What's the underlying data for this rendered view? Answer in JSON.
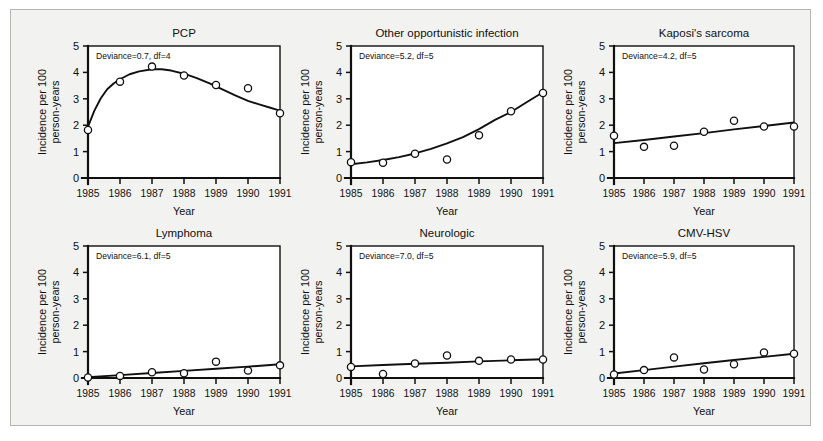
{
  "figure": {
    "background_color": "#f2f2f0",
    "border_color": "#b4b4b2",
    "plot_background": "#ffffff",
    "ink_color": "#101010"
  },
  "axes": {
    "xlabel": "Year",
    "ylabel_line1": "Incidence per 100",
    "ylabel_line2": "person-years",
    "x_tick_labels": [
      "1985",
      "1986",
      "1987",
      "1988",
      "1989",
      "1990",
      "1991"
    ],
    "y_tick_labels": [
      "0",
      "1",
      "2",
      "3",
      "4",
      "5"
    ],
    "xlim": [
      1985,
      1991
    ],
    "ylim": [
      0,
      5
    ]
  },
  "chart_data": [
    {
      "type": "scatter",
      "title": "PCP",
      "annotation": "Deviance=0.7, df=4",
      "deviance": 0.7,
      "df": 4,
      "xlabel": "Year",
      "ylabel": "Incidence per 100 person-years",
      "xlim": [
        1985,
        1991
      ],
      "ylim": [
        0,
        5
      ],
      "grid": false,
      "x": [
        1985,
        1986,
        1987,
        1988,
        1989,
        1990,
        1991
      ],
      "values": [
        1.82,
        3.65,
        4.22,
        3.88,
        3.52,
        3.4,
        2.45
      ],
      "fit_curve": [
        [
          1985.0,
          1.95
        ],
        [
          1985.2,
          2.55
        ],
        [
          1985.4,
          3.02
        ],
        [
          1985.6,
          3.36
        ],
        [
          1985.8,
          3.58
        ],
        [
          1986.0,
          3.74
        ],
        [
          1986.3,
          3.93
        ],
        [
          1986.6,
          4.04
        ],
        [
          1987.0,
          4.12
        ],
        [
          1987.3,
          4.12
        ],
        [
          1987.6,
          4.07
        ],
        [
          1988.0,
          3.95
        ],
        [
          1988.4,
          3.78
        ],
        [
          1988.8,
          3.58
        ],
        [
          1989.2,
          3.36
        ],
        [
          1989.6,
          3.13
        ],
        [
          1990.0,
          2.92
        ],
        [
          1990.4,
          2.77
        ],
        [
          1990.7,
          2.66
        ],
        [
          1991.0,
          2.55
        ]
      ]
    },
    {
      "type": "scatter",
      "title": "Other opportunistic infection",
      "annotation": "Deviance=5.2, df=5",
      "deviance": 5.2,
      "df": 5,
      "xlabel": "Year",
      "ylabel": "Incidence per 100 person-years",
      "xlim": [
        1985,
        1991
      ],
      "ylim": [
        0,
        5
      ],
      "grid": false,
      "x": [
        1985,
        1986,
        1987,
        1988,
        1989,
        1990,
        1991
      ],
      "values": [
        0.6,
        0.58,
        0.92,
        0.7,
        1.62,
        2.53,
        3.22
      ],
      "fit_curve": [
        [
          1985.0,
          0.52
        ],
        [
          1985.5,
          0.59
        ],
        [
          1986.0,
          0.68
        ],
        [
          1986.5,
          0.79
        ],
        [
          1987.0,
          0.93
        ],
        [
          1987.5,
          1.1
        ],
        [
          1988.0,
          1.31
        ],
        [
          1988.5,
          1.55
        ],
        [
          1989.0,
          1.85
        ],
        [
          1989.5,
          2.2
        ],
        [
          1990.0,
          2.5
        ],
        [
          1990.5,
          2.88
        ],
        [
          1991.0,
          3.25
        ]
      ]
    },
    {
      "type": "scatter",
      "title": "Kaposi's sarcoma",
      "annotation": "Deviance=4.2, df=5",
      "deviance": 4.2,
      "df": 5,
      "xlabel": "Year",
      "ylabel": "Incidence per 100 person-years",
      "xlim": [
        1985,
        1991
      ],
      "ylim": [
        0,
        5
      ],
      "grid": false,
      "x": [
        1985,
        1986,
        1987,
        1988,
        1989,
        1990,
        1991
      ],
      "values": [
        1.6,
        1.18,
        1.22,
        1.75,
        2.17,
        1.95,
        1.95
      ],
      "fit_curve": [
        [
          1985.0,
          1.32
        ],
        [
          1986.0,
          1.44
        ],
        [
          1987.0,
          1.57
        ],
        [
          1988.0,
          1.7
        ],
        [
          1989.0,
          1.84
        ],
        [
          1990.0,
          1.97
        ],
        [
          1991.0,
          2.1
        ]
      ]
    },
    {
      "type": "scatter",
      "title": "Lymphoma",
      "annotation": "Deviance=6.1, df=5",
      "deviance": 6.1,
      "df": 5,
      "xlabel": "Year",
      "ylabel": "Incidence per 100 person-years",
      "xlim": [
        1985,
        1991
      ],
      "ylim": [
        0,
        5
      ],
      "grid": false,
      "x": [
        1985,
        1986,
        1987,
        1988,
        1989,
        1990,
        1991
      ],
      "values": [
        0.02,
        0.08,
        0.22,
        0.18,
        0.62,
        0.28,
        0.48
      ],
      "fit_curve": [
        [
          1985.0,
          0.03
        ],
        [
          1986.0,
          0.11
        ],
        [
          1987.0,
          0.19
        ],
        [
          1988.0,
          0.27
        ],
        [
          1989.0,
          0.35
        ],
        [
          1990.0,
          0.43
        ],
        [
          1991.0,
          0.52
        ]
      ]
    },
    {
      "type": "scatter",
      "title": "Neurologic",
      "annotation": "Deviance=7.0, df=5",
      "deviance": 7.0,
      "df": 5,
      "xlabel": "Year",
      "ylabel": "Incidence per 100 person-years",
      "xlim": [
        1985,
        1991
      ],
      "ylim": [
        0,
        5
      ],
      "grid": false,
      "x": [
        1985,
        1986,
        1987,
        1988,
        1989,
        1990,
        1991
      ],
      "values": [
        0.42,
        0.15,
        0.55,
        0.85,
        0.65,
        0.7,
        0.7
      ],
      "fit_curve": [
        [
          1985.0,
          0.44
        ],
        [
          1986.0,
          0.49
        ],
        [
          1987.0,
          0.54
        ],
        [
          1988.0,
          0.58
        ],
        [
          1989.0,
          0.63
        ],
        [
          1990.0,
          0.67
        ],
        [
          1991.0,
          0.71
        ]
      ]
    },
    {
      "type": "scatter",
      "title": "CMV-HSV",
      "annotation": "Deviance=5.9, df=5",
      "deviance": 5.9,
      "df": 5,
      "xlabel": "Year",
      "ylabel": "Incidence per 100 person-years",
      "xlim": [
        1985,
        1991
      ],
      "ylim": [
        0,
        5
      ],
      "grid": false,
      "x": [
        1985,
        1986,
        1987,
        1988,
        1989,
        1990,
        1991
      ],
      "values": [
        0.13,
        0.3,
        0.78,
        0.32,
        0.52,
        0.97,
        0.92
      ],
      "fit_curve": [
        [
          1985.0,
          0.17
        ],
        [
          1986.0,
          0.3
        ],
        [
          1987.0,
          0.43
        ],
        [
          1988.0,
          0.56
        ],
        [
          1989.0,
          0.68
        ],
        [
          1990.0,
          0.8
        ],
        [
          1991.0,
          0.92
        ]
      ]
    }
  ],
  "panel_layout": [
    {
      "left": 20,
      "top": 8,
      "width": 267,
      "height": 208
    },
    {
      "left": 283,
      "top": 8,
      "width": 267,
      "height": 208
    },
    {
      "left": 546,
      "top": 8,
      "width": 255,
      "height": 208
    },
    {
      "left": 20,
      "top": 208,
      "width": 267,
      "height": 208
    },
    {
      "left": 283,
      "top": 208,
      "width": 267,
      "height": 208
    },
    {
      "left": 546,
      "top": 208,
      "width": 255,
      "height": 208
    }
  ]
}
